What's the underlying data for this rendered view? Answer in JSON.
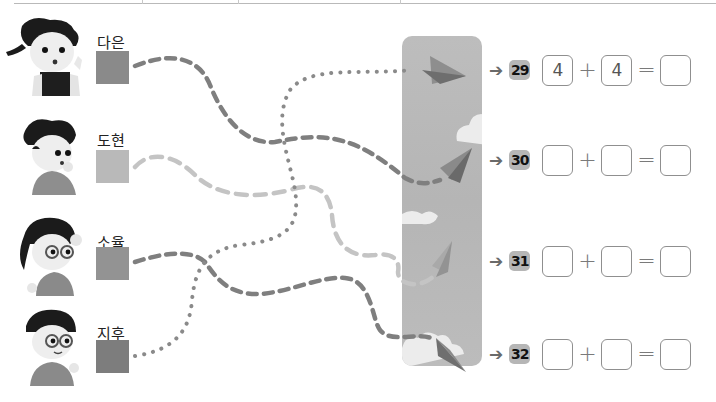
{
  "children": [
    {
      "name": "다은",
      "swatch_color": "#8a8a8a",
      "top": 20
    },
    {
      "name": "도현",
      "swatch_color": "#b9b9b9",
      "top": 120
    },
    {
      "name": "소율",
      "swatch_color": "#939393",
      "top": 222
    },
    {
      "name": "지후",
      "swatch_color": "#7d7d7d",
      "top": 312
    }
  ],
  "problems": [
    {
      "number": "29",
      "a": "4",
      "op1": "+",
      "b": "4",
      "op2": "=",
      "result": "",
      "top": 52
    },
    {
      "number": "30",
      "a": "",
      "op1": "+",
      "b": "",
      "op2": "=",
      "result": "",
      "top": 144
    },
    {
      "number": "31",
      "a": "",
      "op1": "+",
      "b": "",
      "op2": "=",
      "result": "",
      "top": 246
    },
    {
      "number": "32",
      "a": "",
      "op1": "+",
      "b": "",
      "op2": "=",
      "result": "",
      "top": 338
    }
  ],
  "arrow_glyph": "➔",
  "colors": {
    "dark_dash": "#7f7f7f",
    "light_dash": "#c4c4c4",
    "dots": "#8a8a8a",
    "sky": "#b8b8b8",
    "cloud": "#efefef"
  }
}
